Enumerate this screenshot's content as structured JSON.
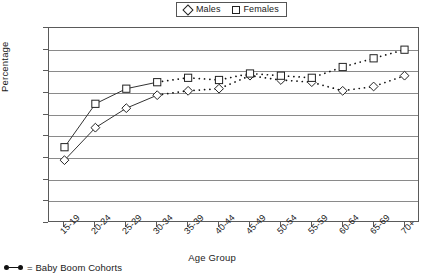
{
  "legend": {
    "position": "top-center",
    "entries": [
      {
        "label": "Males",
        "marker": "diamond-icon"
      },
      {
        "label": "Females",
        "marker": "square-icon"
      }
    ]
  },
  "footnote": {
    "text": "= Baby Boom Cohorts",
    "marker": "dot-line-dot-icon"
  },
  "chart_data": {
    "type": "line",
    "title": "",
    "xlabel": "Age Group",
    "ylabel": "Percentage",
    "ylim": [
      0,
      90
    ],
    "ytick_step": 10,
    "yticks": [
      "90",
      "80",
      "70",
      "60",
      "50",
      "40",
      "30",
      "20",
      "10",
      "0"
    ],
    "grid": true,
    "categories": [
      "15-19",
      "20-24",
      "25-29",
      "30-34",
      "35-39",
      "40-44",
      "45-49",
      "50-54",
      "55-59",
      "60-64",
      "65-69",
      "70+"
    ],
    "series": [
      {
        "name": "Males",
        "marker": "diamond",
        "values": [
          29,
          44,
          53,
          59,
          61,
          62,
          68,
          66,
          65,
          61,
          63,
          68
        ]
      },
      {
        "name": "Females",
        "marker": "square",
        "values": [
          35,
          55,
          62,
          65,
          67,
          66,
          69,
          68,
          67,
          72,
          76,
          80
        ]
      }
    ],
    "annotations": [
      {
        "text": "Baby Boom Cohorts",
        "style": "dotted-line-segment",
        "from_category": "30-34",
        "to_category": "70+"
      }
    ]
  }
}
